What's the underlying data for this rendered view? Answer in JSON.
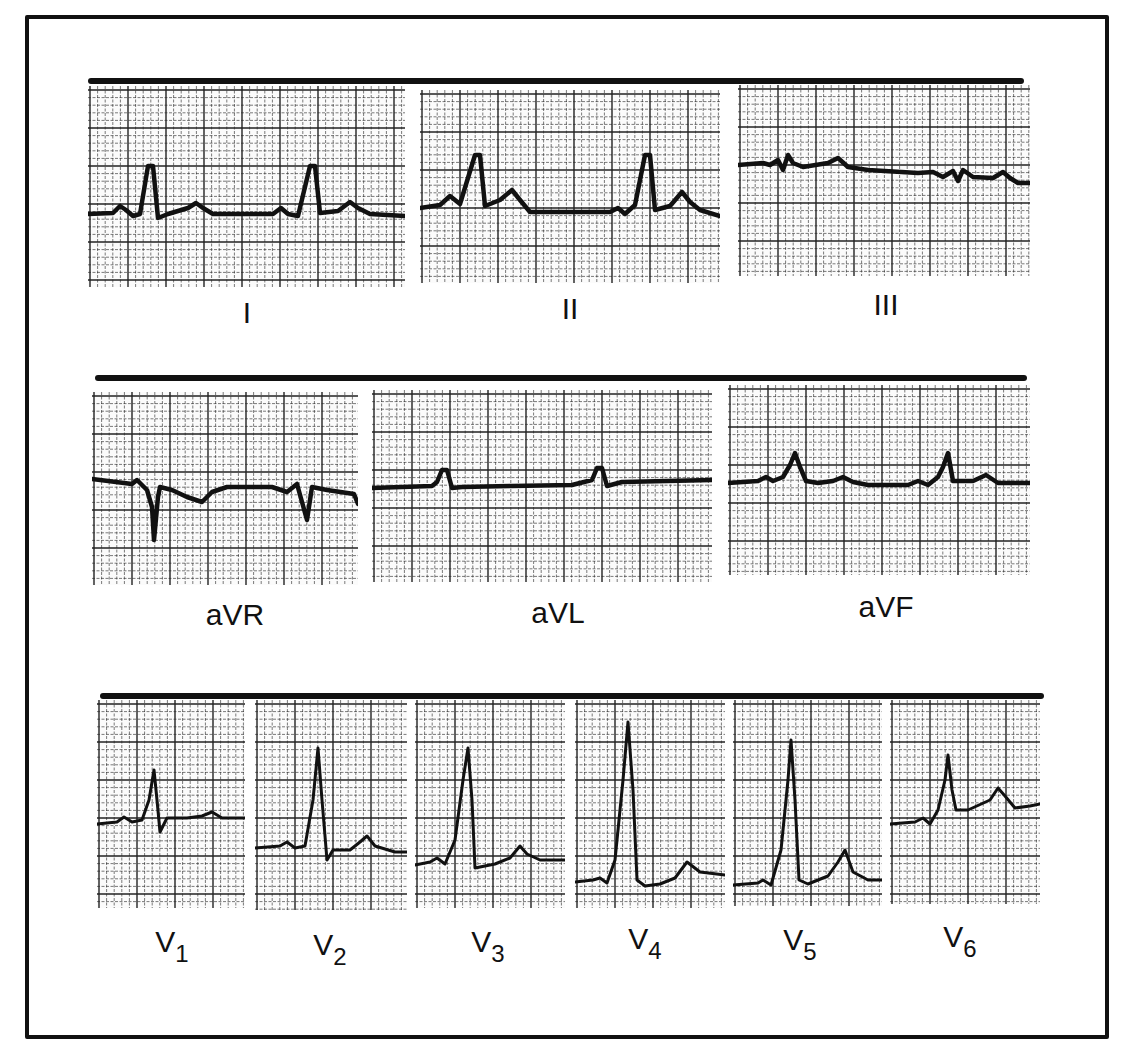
{
  "figure": {
    "rows": [
      {
        "leads": [
          {
            "id": "I",
            "label": "I"
          },
          {
            "id": "II",
            "label": "II"
          },
          {
            "id": "III",
            "label": "III"
          }
        ]
      },
      {
        "leads": [
          {
            "id": "aVR",
            "label": "aVR"
          },
          {
            "id": "aVL",
            "label": "aVL"
          },
          {
            "id": "aVF",
            "label": "aVF"
          }
        ]
      },
      {
        "leads": [
          {
            "id": "V1",
            "label": "V",
            "sub": "1"
          },
          {
            "id": "V2",
            "label": "V",
            "sub": "2"
          },
          {
            "id": "V3",
            "label": "V",
            "sub": "3"
          },
          {
            "id": "V4",
            "label": "V",
            "sub": "4"
          },
          {
            "id": "V5",
            "label": "V",
            "sub": "5"
          },
          {
            "id": "V6",
            "label": "V",
            "sub": "6"
          }
        ]
      }
    ],
    "colors": {
      "trace": "#111111",
      "grid": "#222222",
      "paper": "#fbfbfb",
      "frame": "#111111"
    }
  }
}
